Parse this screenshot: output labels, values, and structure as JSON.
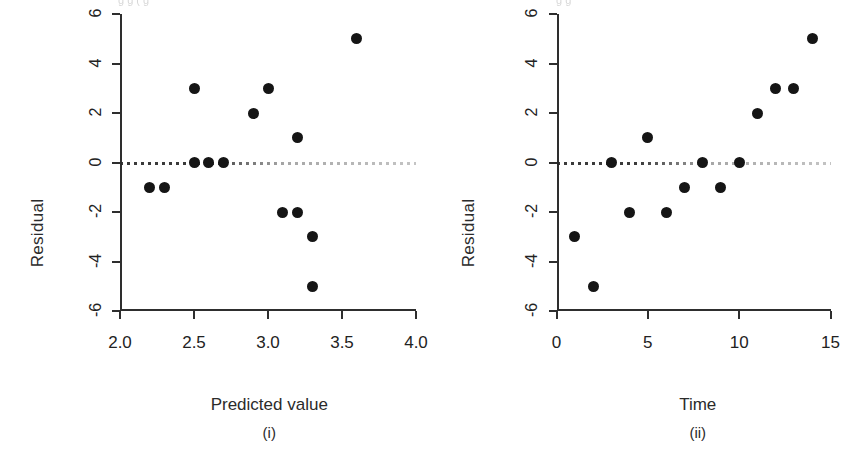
{
  "figure": {
    "top_artifact_left": "g  g      (    g",
    "top_artifact_right": "g      g"
  },
  "chart_data": [
    {
      "type": "scatter",
      "panel_id": "i",
      "caption": "(i)",
      "title": "",
      "xlabel": "Predicted value",
      "ylabel": "Residual",
      "xlim": [
        2.0,
        4.0
      ],
      "ylim": [
        -6,
        6
      ],
      "xticks": [
        2.0,
        2.5,
        3.0,
        3.5,
        4.0
      ],
      "xticklabels": [
        "2.0",
        "2.5",
        "3.0",
        "3.5",
        "4.0"
      ],
      "yticks": [
        6,
        4,
        2,
        0,
        -2,
        -4,
        -6
      ],
      "yticklabels": [
        "6",
        "4",
        "2",
        "0",
        "-2",
        "-4",
        "-6"
      ],
      "grid": false,
      "legend": "none",
      "reference_line": {
        "y": 0,
        "style": "dotted"
      },
      "x": [
        2.2,
        2.3,
        2.5,
        2.5,
        2.6,
        2.7,
        2.9,
        3.0,
        3.1,
        3.2,
        3.2,
        3.3,
        3.3,
        3.6
      ],
      "y": [
        -1,
        -1,
        3,
        0,
        0,
        0,
        2,
        3,
        -2,
        1,
        -2,
        -3,
        -5,
        5
      ],
      "marker": "filled-circle",
      "marker_color": "#151515"
    },
    {
      "type": "scatter",
      "panel_id": "ii",
      "caption": "(ii)",
      "title": "",
      "xlabel": "Time",
      "ylabel": "Residual",
      "xlim": [
        0,
        15
      ],
      "ylim": [
        -6,
        6
      ],
      "xticks": [
        0,
        5,
        10,
        15
      ],
      "xticklabels": [
        "0",
        "5",
        "10",
        "15"
      ],
      "yticks": [
        6,
        4,
        2,
        0,
        -2,
        -4,
        -6
      ],
      "yticklabels": [
        "6",
        "4",
        "2",
        "0",
        "-2",
        "-4",
        "-6"
      ],
      "grid": false,
      "legend": "none",
      "reference_line": {
        "y": 0,
        "style": "dotted"
      },
      "x": [
        1,
        2,
        3,
        4,
        5,
        6,
        7,
        8,
        9,
        10,
        11,
        12,
        13,
        14
      ],
      "y": [
        -3,
        -5,
        0,
        -2,
        1,
        -2,
        -1,
        0,
        -1,
        0,
        2,
        3,
        3,
        5
      ],
      "marker": "filled-circle",
      "marker_color": "#151515"
    }
  ]
}
